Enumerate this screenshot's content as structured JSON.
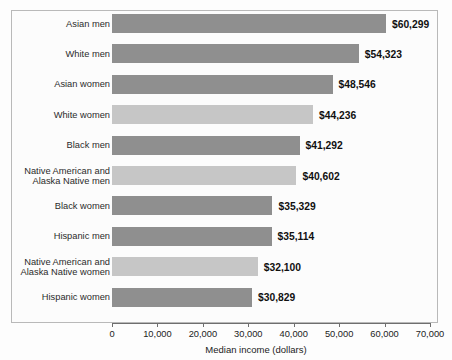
{
  "chart_data": {
    "type": "bar",
    "orientation": "horizontal",
    "title": "AND GENDER",
    "title_note": "cropped at top edge of screenshot",
    "xlabel": "Median income (dollars)",
    "ylabel": "",
    "xlim": [
      0,
      70000
    ],
    "xticks": [
      0,
      10000,
      20000,
      30000,
      40000,
      50000,
      60000,
      70000
    ],
    "xtick_labels": [
      "0",
      "10,000",
      "20,000",
      "30,000",
      "40,000",
      "50,000",
      "60,000",
      "70,000"
    ],
    "grid": false,
    "legend": "none",
    "categories": [
      "Asian men",
      "White men",
      "Asian women",
      "White women",
      "Black men",
      "Native American and\nAlaska Native men",
      "Black women",
      "Hispanic men",
      "Native American and\nAlaska Native women",
      "Hispanic women"
    ],
    "values": [
      60299,
      54323,
      48546,
      44236,
      41292,
      40602,
      35329,
      35114,
      32100,
      30829
    ],
    "value_labels": [
      "$60,299",
      "$54,323",
      "$48,546",
      "$44,236",
      "$41,292",
      "$40,602",
      "$35,329",
      "$35,114",
      "$32,100",
      "$30,829"
    ],
    "bar_colors": [
      "#8f8f8f",
      "#8f8f8f",
      "#8f8f8f",
      "#c6c6c6",
      "#8f8f8f",
      "#c6c6c6",
      "#8f8f8f",
      "#8f8f8f",
      "#c6c6c6",
      "#8f8f8f"
    ]
  },
  "style": {
    "plot_background": "#fcfcfc",
    "frame_color": "#b9b9b9",
    "axis_color": "#6e6e6e",
    "text_color": "#222222",
    "value_text_color": "#101010"
  }
}
